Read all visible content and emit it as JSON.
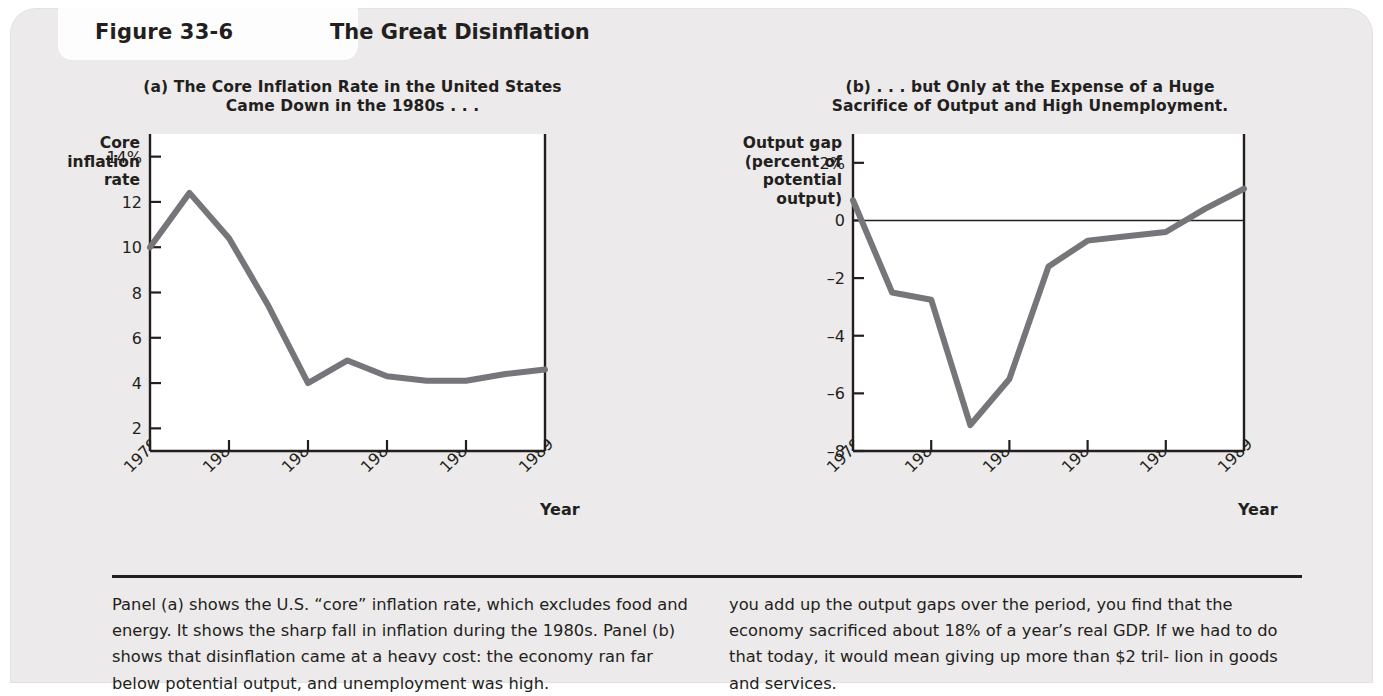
{
  "figure": {
    "label": "Figure",
    "number": "33-6",
    "title": "The Great Disinflation"
  },
  "panel_a": {
    "subtitle_line1": "(a) The Core Inflation Rate in the United States",
    "subtitle_line2": "Came Down in the 1980s . . .",
    "y_axis_title": "Core\ninflation\nrate",
    "x_axis_label": "Year",
    "y_ticks": [
      "14%",
      "12",
      "10",
      "8",
      "6",
      "4",
      "2"
    ],
    "x_ticks": [
      "1979",
      "1981",
      "1983",
      "1985",
      "1987",
      "1989"
    ]
  },
  "panel_b": {
    "subtitle_line1": "(b) . . . but Only at the Expense of a Huge",
    "subtitle_line2": "Sacrifice of Output and High Unemployment.",
    "y_axis_title": "Output gap\n(percent of\npotential\noutput)",
    "x_axis_label": "Year",
    "y_ticks": [
      "2%",
      "0",
      "–2",
      "–4",
      "–6",
      "–8"
    ],
    "x_ticks": [
      "1979",
      "1981",
      "1983",
      "1985",
      "1987",
      "1989"
    ]
  },
  "caption": {
    "left": "Panel (a) shows the U.S. “core” inflation rate, which excludes food and energy. It shows the sharp fall in inflation during the 1980s. Panel (b) shows that disinflation came at a heavy cost: the economy ran far below potential output, and unemployment was high.",
    "right": "you add up the output gaps over the period, you find that the economy sacrificed about 18% of a year’s real GDP. If we had to do that today, it would mean giving up more than $2 tril- lion in goods and services."
  },
  "colors": {
    "line": "#76767a",
    "axis": "#231f20",
    "panel_bg": "#eceaea",
    "plot_bg": "#ffffff",
    "text": "#231f20"
  },
  "chart_data": [
    {
      "type": "line",
      "panel": "a",
      "title": "(a) The Core Inflation Rate in the United States Came Down in the 1980s . . .",
      "xlabel": "Year",
      "ylabel": "Core inflation rate",
      "ylim": [
        1,
        15
      ],
      "xlim": [
        1979,
        1989
      ],
      "ytick_values": [
        14,
        12,
        10,
        8,
        6,
        4,
        2
      ],
      "ytick_labels": [
        "14%",
        "12",
        "10",
        "8",
        "6",
        "4",
        "2"
      ],
      "xtick_values": [
        1979,
        1981,
        1983,
        1985,
        1987,
        1989
      ],
      "xtick_labels": [
        "1979",
        "1981",
        "1983",
        "1985",
        "1987",
        "1989"
      ],
      "grid": false,
      "legend": "none",
      "series": [
        {
          "name": "Core inflation rate",
          "x": [
            1979,
            1980,
            1981,
            1982,
            1983,
            1984,
            1985,
            1986,
            1987,
            1988,
            1989
          ],
          "values": [
            10.0,
            12.4,
            10.4,
            7.4,
            4.0,
            5.0,
            4.3,
            4.1,
            4.1,
            4.4,
            4.6
          ]
        }
      ]
    },
    {
      "type": "line",
      "panel": "b",
      "title": "(b) . . . but Only at the Expense of a Huge Sacrifice of Output and High Unemployment.",
      "xlabel": "Year",
      "ylabel": "Output gap (percent of potential output)",
      "ylim": [
        -8,
        3
      ],
      "xlim": [
        1979,
        1989
      ],
      "ytick_values": [
        2,
        0,
        -2,
        -4,
        -6,
        -8
      ],
      "ytick_labels": [
        "2%",
        "0",
        "–2",
        "–4",
        "–6",
        "–8"
      ],
      "xtick_values": [
        1979,
        1981,
        1983,
        1985,
        1987,
        1989
      ],
      "xtick_labels": [
        "1979",
        "1981",
        "1983",
        "1985",
        "1987",
        "1989"
      ],
      "grid": false,
      "zero_line": true,
      "legend": "none",
      "series": [
        {
          "name": "Output gap",
          "x": [
            1979,
            1980,
            1981,
            1982,
            1983,
            1984,
            1985,
            1986,
            1987,
            1988,
            1989
          ],
          "values": [
            0.7,
            -2.5,
            -2.75,
            -7.1,
            -5.5,
            -1.6,
            -0.7,
            -0.55,
            -0.4,
            0.4,
            1.1
          ]
        }
      ]
    }
  ]
}
